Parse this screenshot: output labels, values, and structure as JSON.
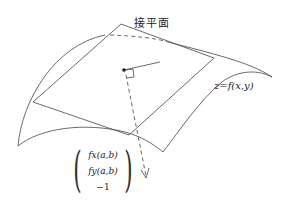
{
  "diagram": {
    "plane_label": "接平面",
    "surface_label": "z=f(x,y)",
    "normal_vector": {
      "row0": "fx(a,b)",
      "row1": "fy(a,b)",
      "row2": "−1"
    }
  },
  "colors": {
    "stroke": "#333333",
    "background": "#ffffff"
  }
}
